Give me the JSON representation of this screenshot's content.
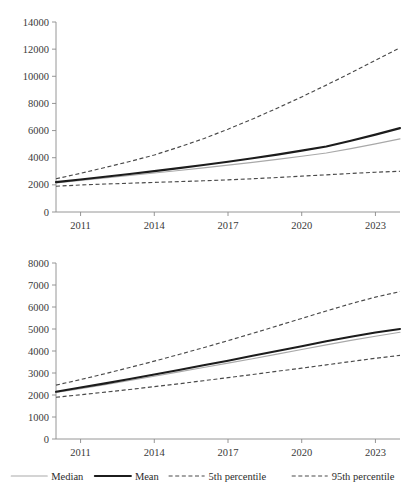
{
  "figure": {
    "background": "#ffffff",
    "colors": {
      "median": "#a9a9a9",
      "mean": "#1c1c1c",
      "p5": "#4a4a4a",
      "p95": "#4a4a4a",
      "axis": "#8a8a8a",
      "text": "#2b2b2b"
    }
  },
  "legend": {
    "position": "bottom",
    "items": [
      {
        "label": "Median",
        "style": "solid-thin-gray",
        "color": "#a9a9a9"
      },
      {
        "label": "Mean",
        "style": "solid-thick-black",
        "color": "#1c1c1c"
      },
      {
        "label": "5th percentile",
        "style": "dashed",
        "color": "#4a4a4a"
      },
      {
        "label": "95th percentile",
        "style": "dashed",
        "color": "#4a4a4a"
      }
    ]
  },
  "chart_data": [
    {
      "id": "top",
      "type": "line",
      "title": "",
      "xlabel": "",
      "ylabel": "",
      "grid": false,
      "legend": "bottom",
      "x": [
        2010,
        2011,
        2012,
        2013,
        2014,
        2015,
        2016,
        2017,
        2018,
        2019,
        2020,
        2021,
        2022,
        2023,
        2024
      ],
      "xlim": [
        2010,
        2024
      ],
      "ylim": [
        0,
        14000
      ],
      "yticks": [
        0,
        2000,
        4000,
        6000,
        8000,
        10000,
        12000,
        14000
      ],
      "ytick_labels": [
        "0",
        "2000",
        "4000",
        "6000",
        "8000",
        "10000",
        "12000",
        "14000"
      ],
      "xticks": [
        2011,
        2014,
        2017,
        2020,
        2023
      ],
      "xtick_labels": [
        "2011",
        "2014",
        "2017",
        "2020",
        "2023"
      ],
      "series": [
        {
          "name": "Median",
          "values": [
            2150,
            2330,
            2510,
            2690,
            2870,
            3060,
            3250,
            3450,
            3660,
            3880,
            4110,
            4350,
            4670,
            5020,
            5390
          ]
        },
        {
          "name": "Mean",
          "values": [
            2200,
            2400,
            2600,
            2800,
            3010,
            3230,
            3460,
            3700,
            3960,
            4230,
            4520,
            4830,
            5250,
            5700,
            6180
          ]
        },
        {
          "name": "5th percentile",
          "values": [
            1900,
            1990,
            2060,
            2120,
            2180,
            2240,
            2300,
            2370,
            2450,
            2540,
            2640,
            2740,
            2840,
            2930,
            3000
          ]
        },
        {
          "name": "95th percentile",
          "values": [
            2450,
            2850,
            3280,
            3720,
            4200,
            4780,
            5400,
            6100,
            6850,
            7650,
            8480,
            9350,
            10250,
            11180,
            12100
          ]
        }
      ]
    },
    {
      "id": "bottom",
      "type": "line",
      "title": "",
      "xlabel": "",
      "ylabel": "",
      "grid": false,
      "legend": "bottom",
      "x": [
        2010,
        2011,
        2012,
        2013,
        2014,
        2015,
        2016,
        2017,
        2018,
        2019,
        2020,
        2021,
        2022,
        2023,
        2024
      ],
      "xlim": [
        2010,
        2024
      ],
      "ylim": [
        0,
        8000
      ],
      "yticks": [
        0,
        1000,
        2000,
        3000,
        4000,
        5000,
        6000,
        7000,
        8000
      ],
      "ytick_labels": [
        "0",
        "1000",
        "2000",
        "3000",
        "4000",
        "5000",
        "6000",
        "7000",
        "8000"
      ],
      "xticks": [
        2011,
        2014,
        2017,
        2020,
        2023
      ],
      "xtick_labels": [
        "2011",
        "2014",
        "2017",
        "2020",
        "2023"
      ],
      "series": [
        {
          "name": "Median",
          "values": [
            2120,
            2290,
            2470,
            2660,
            2850,
            3050,
            3250,
            3450,
            3650,
            3860,
            4070,
            4280,
            4480,
            4670,
            4850
          ]
        },
        {
          "name": "Mean",
          "values": [
            2150,
            2340,
            2530,
            2730,
            2930,
            3140,
            3350,
            3560,
            3780,
            4000,
            4220,
            4440,
            4650,
            4840,
            5000
          ]
        },
        {
          "name": "5th percentile",
          "values": [
            1900,
            2010,
            2130,
            2250,
            2380,
            2510,
            2650,
            2790,
            2930,
            3080,
            3220,
            3370,
            3520,
            3670,
            3800
          ]
        },
        {
          "name": "95th percentile",
          "values": [
            2450,
            2700,
            2970,
            3250,
            3540,
            3840,
            4150,
            4470,
            4800,
            5140,
            5480,
            5820,
            6150,
            6450,
            6700
          ]
        }
      ]
    }
  ]
}
